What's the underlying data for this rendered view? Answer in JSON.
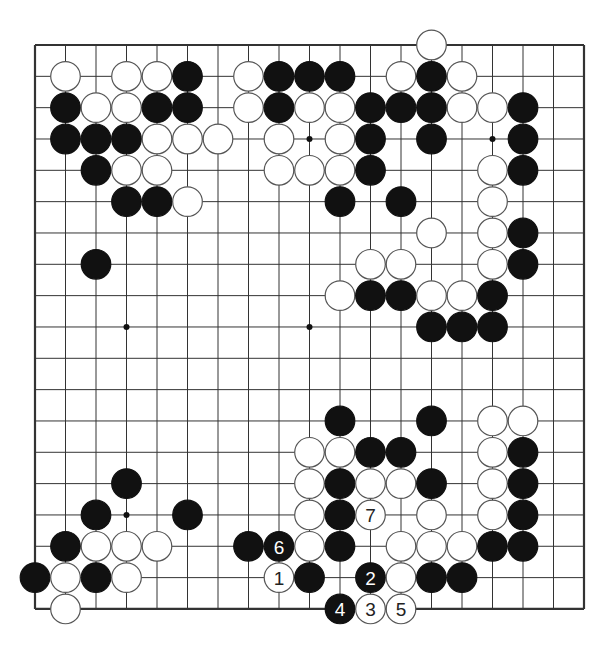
{
  "board": {
    "size": 19,
    "origin_x": 35,
    "origin_y": 45,
    "step_x": 30.5,
    "step_y": 31.33,
    "stone_radius": 14.8,
    "colors": {
      "background": "#ffffff",
      "line": "#333333",
      "black_stone": "#111111",
      "white_stone": "#ffffff",
      "white_stone_border": "#555555"
    },
    "star_points": [
      [
        3,
        3
      ],
      [
        9,
        3
      ],
      [
        15,
        3
      ],
      [
        3,
        9
      ],
      [
        9,
        9
      ],
      [
        15,
        9
      ],
      [
        3,
        15
      ],
      [
        9,
        15
      ],
      [
        15,
        15
      ]
    ]
  },
  "stones": [
    {
      "c": 13,
      "r": 0,
      "color": "W"
    },
    {
      "c": 1,
      "r": 1,
      "color": "W"
    },
    {
      "c": 3,
      "r": 1,
      "color": "W"
    },
    {
      "c": 4,
      "r": 1,
      "color": "W"
    },
    {
      "c": 5,
      "r": 1,
      "color": "B"
    },
    {
      "c": 7,
      "r": 1,
      "color": "W"
    },
    {
      "c": 8,
      "r": 1,
      "color": "B"
    },
    {
      "c": 9,
      "r": 1,
      "color": "B"
    },
    {
      "c": 10,
      "r": 1,
      "color": "B"
    },
    {
      "c": 12,
      "r": 1,
      "color": "W"
    },
    {
      "c": 13,
      "r": 1,
      "color": "B"
    },
    {
      "c": 14,
      "r": 1,
      "color": "W"
    },
    {
      "c": 1,
      "r": 2,
      "color": "B"
    },
    {
      "c": 2,
      "r": 2,
      "color": "W"
    },
    {
      "c": 3,
      "r": 2,
      "color": "W"
    },
    {
      "c": 4,
      "r": 2,
      "color": "B"
    },
    {
      "c": 5,
      "r": 2,
      "color": "B"
    },
    {
      "c": 7,
      "r": 2,
      "color": "W"
    },
    {
      "c": 8,
      "r": 2,
      "color": "B"
    },
    {
      "c": 9,
      "r": 2,
      "color": "W"
    },
    {
      "c": 10,
      "r": 2,
      "color": "W"
    },
    {
      "c": 11,
      "r": 2,
      "color": "B"
    },
    {
      "c": 12,
      "r": 2,
      "color": "B"
    },
    {
      "c": 13,
      "r": 2,
      "color": "B"
    },
    {
      "c": 14,
      "r": 2,
      "color": "W"
    },
    {
      "c": 15,
      "r": 2,
      "color": "W"
    },
    {
      "c": 16,
      "r": 2,
      "color": "B"
    },
    {
      "c": 1,
      "r": 3,
      "color": "B"
    },
    {
      "c": 2,
      "r": 3,
      "color": "B"
    },
    {
      "c": 3,
      "r": 3,
      "color": "B"
    },
    {
      "c": 4,
      "r": 3,
      "color": "W"
    },
    {
      "c": 5,
      "r": 3,
      "color": "W"
    },
    {
      "c": 6,
      "r": 3,
      "color": "W"
    },
    {
      "c": 8,
      "r": 3,
      "color": "W"
    },
    {
      "c": 10,
      "r": 3,
      "color": "W"
    },
    {
      "c": 11,
      "r": 3,
      "color": "B"
    },
    {
      "c": 13,
      "r": 3,
      "color": "B"
    },
    {
      "c": 16,
      "r": 3,
      "color": "B"
    },
    {
      "c": 2,
      "r": 4,
      "color": "B"
    },
    {
      "c": 3,
      "r": 4,
      "color": "W"
    },
    {
      "c": 4,
      "r": 4,
      "color": "W"
    },
    {
      "c": 8,
      "r": 4,
      "color": "W"
    },
    {
      "c": 9,
      "r": 4,
      "color": "W"
    },
    {
      "c": 10,
      "r": 4,
      "color": "W"
    },
    {
      "c": 11,
      "r": 4,
      "color": "B"
    },
    {
      "c": 15,
      "r": 4,
      "color": "W"
    },
    {
      "c": 16,
      "r": 4,
      "color": "B"
    },
    {
      "c": 3,
      "r": 5,
      "color": "B"
    },
    {
      "c": 4,
      "r": 5,
      "color": "B"
    },
    {
      "c": 5,
      "r": 5,
      "color": "W"
    },
    {
      "c": 10,
      "r": 5,
      "color": "B"
    },
    {
      "c": 12,
      "r": 5,
      "color": "B"
    },
    {
      "c": 15,
      "r": 5,
      "color": "W"
    },
    {
      "c": 13,
      "r": 6,
      "color": "W"
    },
    {
      "c": 15,
      "r": 6,
      "color": "W"
    },
    {
      "c": 16,
      "r": 6,
      "color": "B"
    },
    {
      "c": 2,
      "r": 7,
      "color": "B"
    },
    {
      "c": 11,
      "r": 7,
      "color": "W"
    },
    {
      "c": 12,
      "r": 7,
      "color": "W"
    },
    {
      "c": 15,
      "r": 7,
      "color": "W"
    },
    {
      "c": 16,
      "r": 7,
      "color": "B"
    },
    {
      "c": 10,
      "r": 8,
      "color": "W"
    },
    {
      "c": 11,
      "r": 8,
      "color": "B"
    },
    {
      "c": 12,
      "r": 8,
      "color": "B"
    },
    {
      "c": 13,
      "r": 8,
      "color": "W"
    },
    {
      "c": 14,
      "r": 8,
      "color": "W"
    },
    {
      "c": 15,
      "r": 8,
      "color": "B"
    },
    {
      "c": 13,
      "r": 9,
      "color": "B"
    },
    {
      "c": 14,
      "r": 9,
      "color": "B"
    },
    {
      "c": 15,
      "r": 9,
      "color": "B"
    },
    {
      "c": 10,
      "r": 12,
      "color": "B"
    },
    {
      "c": 13,
      "r": 12,
      "color": "B"
    },
    {
      "c": 15,
      "r": 12,
      "color": "W"
    },
    {
      "c": 16,
      "r": 12,
      "color": "W"
    },
    {
      "c": 9,
      "r": 13,
      "color": "W"
    },
    {
      "c": 10,
      "r": 13,
      "color": "W"
    },
    {
      "c": 11,
      "r": 13,
      "color": "B"
    },
    {
      "c": 12,
      "r": 13,
      "color": "B"
    },
    {
      "c": 15,
      "r": 13,
      "color": "W"
    },
    {
      "c": 16,
      "r": 13,
      "color": "B"
    },
    {
      "c": 3,
      "r": 14,
      "color": "B"
    },
    {
      "c": 9,
      "r": 14,
      "color": "W"
    },
    {
      "c": 10,
      "r": 14,
      "color": "B"
    },
    {
      "c": 11,
      "r": 14,
      "color": "W"
    },
    {
      "c": 12,
      "r": 14,
      "color": "W"
    },
    {
      "c": 13,
      "r": 14,
      "color": "B"
    },
    {
      "c": 15,
      "r": 14,
      "color": "W"
    },
    {
      "c": 16,
      "r": 14,
      "color": "B"
    },
    {
      "c": 2,
      "r": 15,
      "color": "B"
    },
    {
      "c": 5,
      "r": 15,
      "color": "B"
    },
    {
      "c": 9,
      "r": 15,
      "color": "W"
    },
    {
      "c": 10,
      "r": 15,
      "color": "B"
    },
    {
      "c": 11,
      "r": 15,
      "color": "W",
      "label": "7"
    },
    {
      "c": 13,
      "r": 15,
      "color": "W"
    },
    {
      "c": 15,
      "r": 15,
      "color": "W"
    },
    {
      "c": 16,
      "r": 15,
      "color": "B"
    },
    {
      "c": 1,
      "r": 16,
      "color": "B"
    },
    {
      "c": 2,
      "r": 16,
      "color": "W"
    },
    {
      "c": 3,
      "r": 16,
      "color": "W"
    },
    {
      "c": 4,
      "r": 16,
      "color": "W"
    },
    {
      "c": 7,
      "r": 16,
      "color": "B"
    },
    {
      "c": 8,
      "r": 16,
      "color": "B",
      "label": "6"
    },
    {
      "c": 9,
      "r": 16,
      "color": "W"
    },
    {
      "c": 10,
      "r": 16,
      "color": "B"
    },
    {
      "c": 12,
      "r": 16,
      "color": "W"
    },
    {
      "c": 13,
      "r": 16,
      "color": "W"
    },
    {
      "c": 14,
      "r": 16,
      "color": "W"
    },
    {
      "c": 15,
      "r": 16,
      "color": "B"
    },
    {
      "c": 16,
      "r": 16,
      "color": "B"
    },
    {
      "c": 0,
      "r": 17,
      "color": "B"
    },
    {
      "c": 1,
      "r": 17,
      "color": "W"
    },
    {
      "c": 2,
      "r": 17,
      "color": "B"
    },
    {
      "c": 3,
      "r": 17,
      "color": "W"
    },
    {
      "c": 8,
      "r": 17,
      "color": "W",
      "label": "1"
    },
    {
      "c": 9,
      "r": 17,
      "color": "B"
    },
    {
      "c": 11,
      "r": 17,
      "color": "B",
      "label": "2"
    },
    {
      "c": 12,
      "r": 17,
      "color": "W"
    },
    {
      "c": 13,
      "r": 17,
      "color": "B"
    },
    {
      "c": 14,
      "r": 17,
      "color": "B"
    },
    {
      "c": 1,
      "r": 18,
      "color": "W"
    },
    {
      "c": 10,
      "r": 18,
      "color": "B",
      "label": "4"
    },
    {
      "c": 11,
      "r": 18,
      "color": "W",
      "label": "3"
    },
    {
      "c": 12,
      "r": 18,
      "color": "W",
      "label": "5"
    }
  ],
  "move_sequence": [
    {
      "n": "1",
      "color": "W",
      "c": 8,
      "r": 17
    },
    {
      "n": "2",
      "color": "B",
      "c": 11,
      "r": 17
    },
    {
      "n": "3",
      "color": "W",
      "c": 11,
      "r": 18
    },
    {
      "n": "4",
      "color": "B",
      "c": 10,
      "r": 18
    },
    {
      "n": "5",
      "color": "W",
      "c": 12,
      "r": 18
    },
    {
      "n": "6",
      "color": "B",
      "c": 8,
      "r": 16
    },
    {
      "n": "7",
      "color": "W",
      "c": 11,
      "r": 15
    }
  ]
}
